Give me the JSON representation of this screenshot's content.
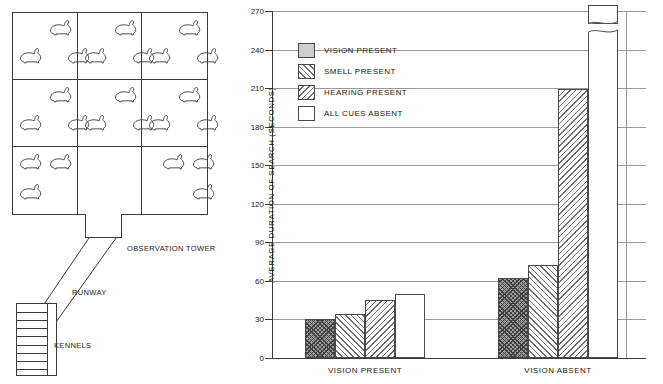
{
  "map": {
    "title": "rabbit-pen-facility-map",
    "pens": [
      {
        "id": "pen-1",
        "rabbits": 3
      },
      {
        "id": "pen-2",
        "rabbits": 3
      },
      {
        "id": "pen-3",
        "rabbits": 3
      },
      {
        "id": "pen-4",
        "rabbits": 3
      },
      {
        "id": "pen-5",
        "rabbits": 3
      },
      {
        "id": "pen-6",
        "rabbits": 3
      },
      {
        "id": "pen-7",
        "rabbits": 3
      },
      {
        "id": "pen-8",
        "rabbits": 0
      },
      {
        "id": "pen-9",
        "rabbits": 3
      }
    ],
    "labels": {
      "observation_tower": "OBSERVATION TOWER",
      "runway": "RUNWAY",
      "kennels": "KENNELS"
    },
    "kennel_count": 9,
    "animal_icon": "rabbit-icon"
  },
  "chart_data": {
    "type": "bar",
    "title": "",
    "xlabel": "",
    "ylabel": "AVERAGE DURATION OF SEARCH (SECONDS)",
    "ylim": [
      0,
      270
    ],
    "ytick_step": 30,
    "yticks": [
      0,
      30,
      60,
      90,
      120,
      150,
      180,
      210,
      240,
      270
    ],
    "grid": true,
    "legend_position": "upper-left-inside",
    "categories": [
      "VISION PRESENT",
      "VISION ABSENT"
    ],
    "series": [
      {
        "name": "VISION PRESENT",
        "pattern": "dark-crosshatch",
        "values": [
          30,
          62
        ]
      },
      {
        "name": "SMELL PRESENT",
        "pattern": "forward-diagonal",
        "values": [
          34,
          72
        ]
      },
      {
        "name": "HEARING PRESENT",
        "pattern": "reverse-diagonal",
        "values": [
          45,
          209
        ]
      },
      {
        "name": "ALL CUES ABSENT",
        "pattern": "white",
        "values": [
          50,
          1332
        ]
      }
    ],
    "annotations": [
      {
        "name": "axis-break-note",
        "text": "22.2  MINUTES",
        "applies_to": "ALL CUES ABSENT / VISION ABSENT",
        "broken_axis": true
      }
    ],
    "legend": [
      {
        "label": "VISION PRESENT",
        "swatch": "solid-gray"
      },
      {
        "label": "SMELL PRESENT",
        "swatch": "forward-diagonal"
      },
      {
        "label": "HEARING PRESENT",
        "swatch": "reverse-diagonal"
      },
      {
        "label": "ALL CUES ABSENT",
        "swatch": "white"
      }
    ],
    "colors": {
      "axis": "#3b3b3b",
      "gridline": "#9a9a9a",
      "bar_outline": "#4a4a4a",
      "solid_gray": "#cdcdcd",
      "hatch": "#6f6f6f",
      "background": "#ffffff"
    }
  }
}
